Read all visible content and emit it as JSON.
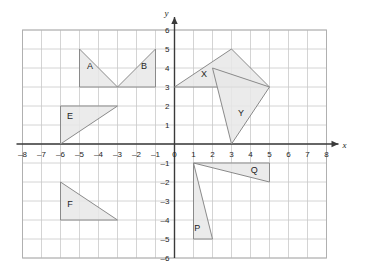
{
  "chart_data": {
    "type": "scatter",
    "title": "",
    "xlabel": "x",
    "ylabel": "y",
    "xlim": [
      -8,
      8
    ],
    "ylim": [
      -6,
      6
    ],
    "grid": true,
    "grid_step": 1,
    "legend": "none",
    "x_tick_labels": [
      "-8",
      "-7",
      "-6",
      "-5",
      "-4",
      "-3",
      "-2",
      "-1",
      "0",
      "1",
      "2",
      "3",
      "4",
      "5",
      "6",
      "7",
      "8"
    ],
    "y_tick_labels": [
      "-6",
      "-5",
      "-4",
      "-3",
      "-2",
      "-1",
      "0",
      "1",
      "2",
      "3",
      "4",
      "5",
      "6"
    ],
    "grid_extent": {
      "x_min": -8,
      "x_max": 8,
      "y_min": -6,
      "y_max": 6
    },
    "shapes": [
      {
        "label": "A",
        "vertices": [
          [
            -5,
            5
          ],
          [
            -5,
            3
          ],
          [
            -3,
            3
          ]
        ],
        "label_position": [
          -4.45,
          3.95
        ]
      },
      {
        "label": "B",
        "vertices": [
          [
            -3,
            3
          ],
          [
            -1,
            3
          ],
          [
            -1,
            5
          ]
        ],
        "label_position": [
          -1.6,
          3.95
        ]
      },
      {
        "label": "E",
        "vertices": [
          [
            -6,
            2
          ],
          [
            -6,
            0
          ],
          [
            -3,
            2
          ]
        ],
        "label_position": [
          -5.5,
          1.3
        ]
      },
      {
        "label": "F",
        "vertices": [
          [
            -6,
            -2
          ],
          [
            -6,
            -4
          ],
          [
            -3,
            -4
          ]
        ],
        "label_position": [
          -5.5,
          -3.3
        ]
      },
      {
        "label": "X",
        "vertices": [
          [
            0,
            3
          ],
          [
            3,
            5
          ],
          [
            5,
            3
          ]
        ],
        "label_position": [
          1.55,
          3.55
        ]
      },
      {
        "label": "Y",
        "vertices": [
          [
            2,
            4
          ],
          [
            5,
            3
          ],
          [
            3,
            0
          ]
        ],
        "label_position": [
          3.5,
          1.45
        ]
      },
      {
        "label": "Q",
        "vertices": [
          [
            1,
            -1
          ],
          [
            5,
            -1
          ],
          [
            5,
            -2
          ]
        ],
        "label_position": [
          4.2,
          -1.5
        ]
      },
      {
        "label": "P",
        "vertices": [
          [
            1,
            -1
          ],
          [
            1,
            -5
          ],
          [
            2,
            -5
          ]
        ],
        "label_position": [
          1.2,
          -4.6
        ]
      }
    ],
    "colors": {
      "shape_fill": "#e8e8e8",
      "shape_stroke": "#8a8a8a",
      "grid": "#c9c9c9",
      "axis": "#3a3a3a",
      "text": "#1d1d1d",
      "background": "#ffffff"
    }
  }
}
